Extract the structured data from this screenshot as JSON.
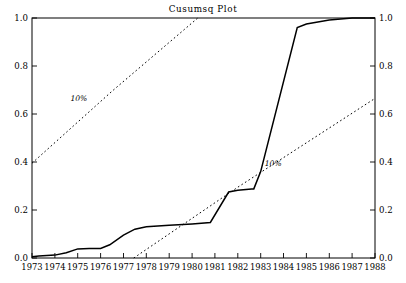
{
  "chart_data": {
    "type": "line",
    "title": "Cusumsq Plot",
    "xlabel": "",
    "ylabel": "",
    "xlim": [
      1973,
      1988
    ],
    "ylim": [
      0.0,
      1.0
    ],
    "grid": false,
    "legend_position": "inline-annotation",
    "x_tick_labels": [
      "1973",
      "1974",
      "1975",
      "1976",
      "1977",
      "1978",
      "1979",
      "1980",
      "1981",
      "1982",
      "1983",
      "1984",
      "1985",
      "1986",
      "1987",
      "1988"
    ],
    "x_tick_values": [
      1973,
      1974,
      1975,
      1976,
      1977,
      1978,
      1979,
      1980,
      1981,
      1982,
      1983,
      1984,
      1985,
      1986,
      1987,
      1988
    ],
    "y_tick_labels_left": [
      "0.0",
      "0.2",
      "0.4",
      "0.6",
      "0.8",
      "1.0"
    ],
    "y_tick_labels_right": [
      "0.0",
      "0.2",
      "0.4",
      "0.6",
      "0.8",
      "1.0"
    ],
    "y_tick_values": [
      0.0,
      0.2,
      0.4,
      0.6,
      0.8,
      1.0
    ],
    "series": [
      {
        "name": "cusumsq",
        "style": "solid",
        "x": [
          1973.0,
          1973.3,
          1974.0,
          1974.5,
          1975.0,
          1975.5,
          1976.0,
          1976.4,
          1977.0,
          1977.5,
          1978.0,
          1979.0,
          1980.0,
          1980.8,
          1981.6,
          1982.0,
          1982.6,
          1982.7,
          1983.0,
          1984.6,
          1985.0,
          1986.0,
          1987.0,
          1988.0
        ],
        "y": [
          0.005,
          0.008,
          0.012,
          0.022,
          0.038,
          0.04,
          0.04,
          0.055,
          0.095,
          0.12,
          0.13,
          0.136,
          0.142,
          0.148,
          0.275,
          0.282,
          0.288,
          0.288,
          0.36,
          0.96,
          0.975,
          0.992,
          1.0,
          1.0
        ]
      },
      {
        "name": "upper 10% significance bound",
        "style": "dotted",
        "x": [
          1973.0,
          1976.5,
          1980.25
        ],
        "y": [
          0.395,
          0.695,
          1.0
        ]
      },
      {
        "name": "lower 10% significance bound",
        "style": "dotted",
        "x": [
          1977.45,
          1982.0,
          1988.0
        ],
        "y": [
          0.0,
          0.295,
          0.665
        ]
      }
    ],
    "annotations": [
      {
        "text": "10%",
        "x": 1975.05,
        "y": 0.655
      },
      {
        "text": "10%",
        "x": 1983.55,
        "y": 0.385
      }
    ]
  },
  "colors": {
    "background": "#ffffff",
    "foreground": "#000000",
    "curve": "#000000",
    "bounds": "#000000"
  }
}
